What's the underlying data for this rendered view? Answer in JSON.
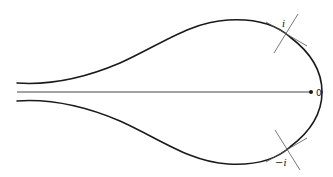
{
  "figure": {
    "labels": {
      "origin": "0",
      "upper_point": "i",
      "lower_point": "−i"
    },
    "colors": {
      "curve": "#1a1a1a",
      "axis": "#333333",
      "auxiliary_lines": "#555555",
      "background": "#ffffff"
    }
  }
}
